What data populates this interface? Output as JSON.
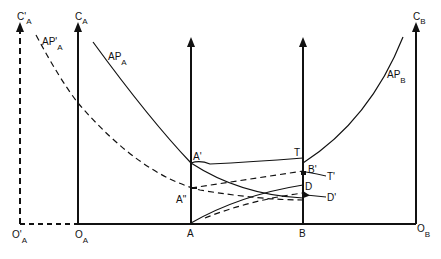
{
  "diagram": {
    "axes": {
      "c_prime_a": {
        "label": "C'",
        "sub": "A"
      },
      "c_a": {
        "label": "C",
        "sub": "A"
      },
      "c_b": {
        "label": "C",
        "sub": "B"
      }
    },
    "origins": {
      "o_prime_a": {
        "label": "O'",
        "sub": "A"
      },
      "o_a": {
        "label": "O",
        "sub": "A"
      },
      "o_b": {
        "label": "O",
        "sub": "B"
      }
    },
    "points": {
      "a": "A",
      "b": "B",
      "a_prime": "A'",
      "a_double_prime": "A\"",
      "t": "T",
      "t_prime": "T'",
      "b_prime": "B'",
      "d": "D",
      "d_prime": "D'"
    },
    "curves": {
      "ap_a": {
        "label": "AP",
        "sub": "A"
      },
      "ap_prime_a": {
        "label": "AP'",
        "sub": "A"
      },
      "ap_b": {
        "label": "AP",
        "sub": "B"
      }
    },
    "colors": {
      "ink": "#111111",
      "background": "#ffffff"
    }
  }
}
